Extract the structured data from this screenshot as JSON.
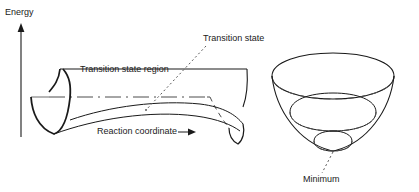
{
  "figure": {
    "background_color": "#ffffff",
    "line_color": "#1a1a1a",
    "text_color": "#1a1a1a"
  },
  "axis": {
    "energy_label": "Energy",
    "orientation": "vertical",
    "arrow_direction": "up"
  },
  "labels": {
    "energy": "Energy",
    "transition_state_region": "Transition state region",
    "transition_state": "Transition state",
    "reaction_coordinate": "Reaction coordinate",
    "minimum": "Minimum"
  },
  "surfaces": [
    {
      "name": "saddle-surface",
      "description": "Saddle-shaped potential energy surface containing the transition state region",
      "features": [
        "left valley",
        "saddle point",
        "right valley",
        "flat top plateau"
      ]
    },
    {
      "name": "bowl-surface",
      "description": "Bowl-shaped potential energy surface with concentric contours converging on a minimum",
      "features": [
        "elliptical rim",
        "mid contour",
        "inner contour",
        "minimum point"
      ]
    }
  ],
  "leaders": [
    {
      "name": "transition-state-leader",
      "style": "dotted",
      "from": "Transition state",
      "to": "saddle point"
    },
    {
      "name": "minimum-leader",
      "style": "dotted",
      "from": "Minimum",
      "to": "bowl bottom"
    },
    {
      "name": "reaction-coordinate-arrow",
      "style": "solid-with-arrowhead",
      "direction": "right"
    }
  ]
}
